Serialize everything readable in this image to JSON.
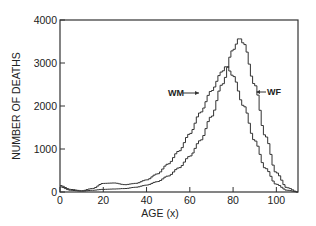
{
  "chart_data": {
    "type": "line",
    "style": "step",
    "title": "",
    "xlabel": "AGE (x)",
    "ylabel": "NUMBER OF DEATHS",
    "xlim": [
      0,
      110
    ],
    "ylim": [
      0,
      4000
    ],
    "x_ticks": [
      0,
      20,
      40,
      60,
      80,
      100
    ],
    "x_tick_labels": [
      "0",
      "20",
      "40",
      "60",
      "80",
      "100"
    ],
    "y_ticks": [
      0,
      1000,
      2000,
      3000,
      4000
    ],
    "y_tick_labels": [
      "0",
      "1000",
      "2000",
      "3000",
      "4000"
    ],
    "grid": false,
    "legend": "inline arrow labels",
    "series": [
      {
        "name": "WM",
        "x": [
          0,
          5,
          10,
          15,
          20,
          25,
          30,
          35,
          40,
          45,
          50,
          55,
          60,
          65,
          70,
          75,
          77,
          80,
          85,
          90,
          95,
          100,
          105,
          110
        ],
        "values": [
          150,
          60,
          30,
          80,
          200,
          210,
          170,
          200,
          280,
          420,
          650,
          950,
          1350,
          1850,
          2350,
          2800,
          2930,
          2700,
          2000,
          1200,
          550,
          180,
          40,
          0
        ],
        "label_pos": {
          "age": 64,
          "deaths": 2300
        }
      },
      {
        "name": "WF",
        "x": [
          0,
          5,
          10,
          15,
          20,
          25,
          30,
          35,
          40,
          45,
          50,
          55,
          60,
          65,
          70,
          75,
          80,
          83,
          85,
          90,
          95,
          100,
          105,
          110
        ],
        "values": [
          120,
          40,
          20,
          40,
          60,
          70,
          80,
          110,
          160,
          240,
          370,
          560,
          830,
          1200,
          1750,
          2500,
          3300,
          3580,
          3450,
          2500,
          1300,
          450,
          100,
          0
        ],
        "label_pos": {
          "age": 90,
          "deaths": 2300
        }
      }
    ]
  }
}
